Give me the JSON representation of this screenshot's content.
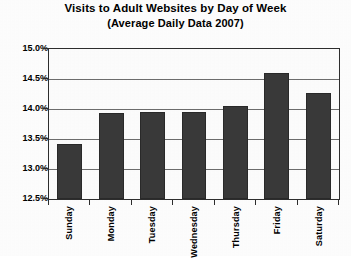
{
  "chart_data": {
    "type": "bar",
    "title": "Visits to Adult Websites by Day of Week",
    "subtitle": "(Average Daily Data 2007)",
    "xlabel": "",
    "ylabel": "",
    "categories": [
      "Sunday",
      "Monday",
      "Tuesday",
      "Wednesday",
      "Thursday",
      "Friday",
      "Saturday"
    ],
    "values": [
      13.42,
      13.93,
      13.95,
      13.95,
      14.05,
      14.6,
      14.26
    ],
    "value_format": "percent",
    "ylim": [
      12.5,
      15.0
    ],
    "ytick_labels": [
      "15.0%",
      "14.5%",
      "14.0%",
      "13.5%",
      "13.0%",
      "12.5%"
    ],
    "ytick_values": [
      15.0,
      14.5,
      14.0,
      13.5,
      13.0,
      12.5
    ],
    "grid": true,
    "legend": false,
    "bar_color": "#3a3a3a",
    "plot_background": "#fefefe",
    "axis_color": "#2e2e2e"
  }
}
